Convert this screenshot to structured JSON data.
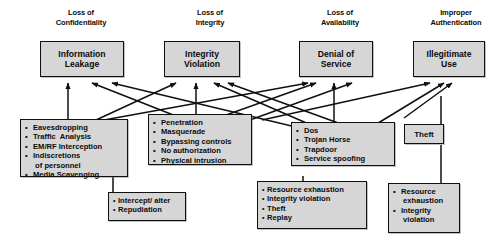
{
  "diagram": {
    "box_fill": "#d6d6d6",
    "line_color": "#101010",
    "background": "#ffffff",
    "headers": [
      {
        "id": "confidentiality",
        "label": "Loss of\nConfidentiality"
      },
      {
        "id": "integrity",
        "label": "Loss of\nIntegrity"
      },
      {
        "id": "availability",
        "label": "Loss of\nAvailability"
      },
      {
        "id": "authentication",
        "label": "Improper\nAuthentication"
      }
    ],
    "nodes": [
      {
        "id": "information-leakage",
        "label": "Information\nLeakage"
      },
      {
        "id": "integrity-violation",
        "label": "Integrity\nViolation"
      },
      {
        "id": "denial-of-service",
        "label": "Denial of\nService"
      },
      {
        "id": "illegitimate-use",
        "label": "Illegitimate\nUse"
      }
    ],
    "method_boxes": [
      {
        "id": "confidentiality-methods",
        "items": [
          "Eavesdropping",
          "Traffic  Analysis",
          "EM/RF Interception",
          "Indiscretions",
          " of personnel",
          "Media Scavenging"
        ],
        "bulleted": [
          true,
          true,
          true,
          true,
          false,
          true
        ]
      },
      {
        "id": "integrity-methods",
        "items": [
          "Penetration",
          "Masquerade",
          "Bypassing controls",
          "No authorization",
          "Physical intrusion"
        ],
        "bulleted": [
          true,
          true,
          true,
          true,
          true
        ]
      },
      {
        "id": "availability-methods",
        "items": [
          "Dos",
          "Trojan Horse",
          "Trapdoor",
          "Service spoofing"
        ],
        "bulleted": [
          true,
          true,
          true,
          true
        ]
      },
      {
        "id": "integrity-consequences",
        "items": [
          "Intercept/ alter",
          "Repudiation"
        ],
        "bulleted": [
          true,
          true
        ]
      },
      {
        "id": "availability-consequences",
        "items": [
          "Resource exhaustion",
          "Integrity violation",
          "Theft",
          "Replay"
        ],
        "bulleted": [
          true,
          true,
          true,
          true
        ]
      },
      {
        "id": "authentication-consequences",
        "items": [
          "Resource",
          " exhaustion",
          "Integrity",
          " violation"
        ],
        "bulleted": [
          true,
          false,
          true,
          false
        ]
      }
    ],
    "small_nodes": [
      {
        "id": "theft",
        "label": "Theft"
      }
    ]
  }
}
